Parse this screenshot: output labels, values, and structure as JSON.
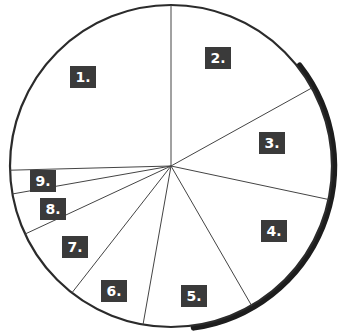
{
  "figure": {
    "name": "numbered-pie-chart",
    "background_color": "#ffffff",
    "outline_color": "#2b2b2b",
    "slice_line_color": "#444444",
    "label_box_color": "#3a3a3a",
    "label_text_color": "#ffffff",
    "shadow_color": "#1a1a1a"
  },
  "chart_data": {
    "type": "pie",
    "title": "",
    "xlabel": "",
    "ylabel": "",
    "grid": false,
    "legend": "none",
    "center": [
      171,
      166
    ],
    "radius": 161,
    "start_angle_deg": 90,
    "direction": "clockwise",
    "categories": [
      "1.",
      "2.",
      "3.",
      "4.",
      "5.",
      "6.",
      "7.",
      "8.",
      "9."
    ],
    "labels": [
      "1.",
      "2.",
      "3.",
      "4.",
      "5.",
      "6.",
      "7.",
      "8.",
      "9."
    ],
    "values": [
      25.4,
      17.0,
      11.4,
      13.3,
      11.1,
      7.8,
      7.5,
      4.2,
      2.3
    ],
    "angles_deg": [
      91.5,
      61.0,
      41.0,
      48.0,
      40.0,
      28.0,
      27.0,
      15.0,
      8.5
    ],
    "boundary_angles_deg": [
      90,
      29,
      -12,
      -60,
      -100,
      -128,
      -155,
      -170,
      -178.5
    ],
    "slices": [
      {
        "label": "1.",
        "value": 25.4,
        "start_deg": 90,
        "end_deg": 181.5,
        "label_x": 70,
        "label_y": 66
      },
      {
        "label": "2.",
        "value": 17.0,
        "start_deg": 29,
        "end_deg": 90,
        "label_x": 205,
        "label_y": 47
      },
      {
        "label": "3.",
        "value": 11.4,
        "start_deg": -12,
        "end_deg": 29,
        "label_x": 259,
        "label_y": 132
      },
      {
        "label": "4.",
        "value": 13.3,
        "start_deg": -60,
        "end_deg": -12,
        "label_x": 261,
        "label_y": 220
      },
      {
        "label": "5.",
        "value": 11.1,
        "start_deg": -100,
        "end_deg": -60,
        "label_x": 181,
        "label_y": 285
      },
      {
        "label": "6.",
        "value": 7.8,
        "start_deg": -128,
        "end_deg": -100,
        "label_x": 101,
        "label_y": 280
      },
      {
        "label": "7.",
        "value": 7.5,
        "start_deg": -155,
        "end_deg": -128,
        "label_x": 62,
        "label_y": 236
      },
      {
        "label": "8.",
        "value": 4.2,
        "start_deg": -170,
        "end_deg": -155,
        "label_x": 40,
        "label_y": 198
      },
      {
        "label": "9.",
        "value": 2.3,
        "start_deg": -178.5,
        "end_deg": -170,
        "label_x": 30,
        "label_y": 170
      }
    ]
  }
}
